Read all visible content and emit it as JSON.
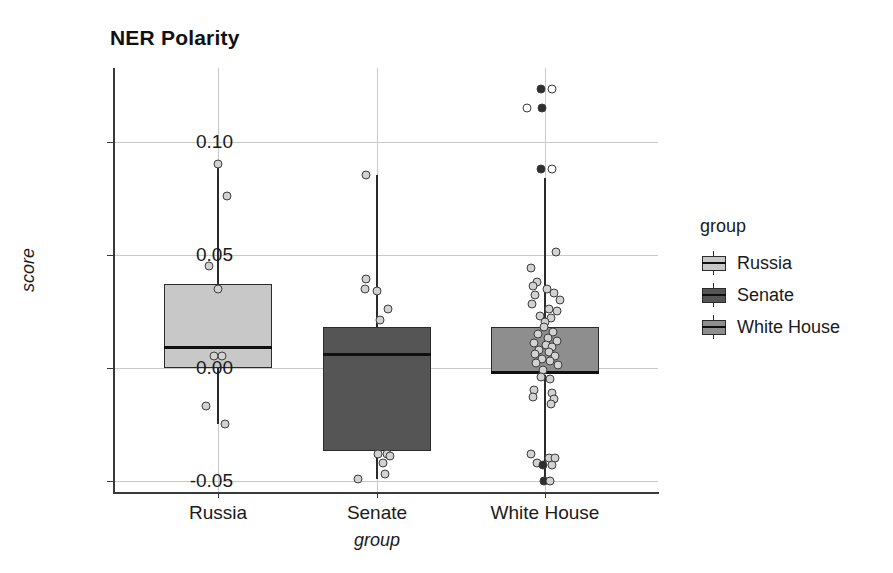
{
  "chart_data": {
    "type": "box",
    "title": "NER Polarity",
    "xlabel": "group",
    "ylabel": "score",
    "categories": [
      "Russia",
      "Senate",
      "White House"
    ],
    "ylim": [
      -0.062,
      0.132
    ],
    "yticks": [
      0.1,
      0.05,
      0.0,
      -0.05
    ],
    "ytick_labels": [
      "0.10",
      "0.05",
      "0.00",
      "-0.05"
    ],
    "grid": "horizontal-and-vertical",
    "legend": {
      "title": "group",
      "position": "right",
      "entries": [
        {
          "label": "Russia",
          "color": "#c8c8c8"
        },
        {
          "label": "Senate",
          "color": "#555555"
        },
        {
          "label": "White House",
          "color": "#8e8e8e"
        }
      ]
    },
    "boxes": [
      {
        "category": "Russia",
        "color": "#c8c8c8",
        "q1": 0.0,
        "median": 0.009,
        "q3": 0.037,
        "whisker_low": -0.025,
        "whisker_high": 0.09,
        "points": [
          {
            "value": 0.09,
            "offset": 0
          },
          {
            "value": 0.076,
            "offset": 9
          },
          {
            "value": 0.045,
            "offset": -9
          },
          {
            "value": 0.035,
            "offset": 0
          },
          {
            "value": 0.005,
            "offset": -4
          },
          {
            "value": 0.005,
            "offset": 4
          },
          {
            "value": -0.017,
            "offset": -12
          },
          {
            "value": -0.025,
            "offset": 7
          }
        ]
      },
      {
        "category": "Senate",
        "color": "#555555",
        "q1": -0.037,
        "median": 0.006,
        "q3": 0.018,
        "whisker_low": -0.049,
        "whisker_high": 0.085,
        "points": [
          {
            "value": 0.085,
            "offset": -11
          },
          {
            "value": 0.039,
            "offset": -11
          },
          {
            "value": 0.035,
            "offset": -12
          },
          {
            "value": 0.034,
            "offset": 0
          },
          {
            "value": 0.026,
            "offset": 11
          },
          {
            "value": 0.021,
            "offset": 3
          },
          {
            "value": -0.038,
            "offset": 1
          },
          {
            "value": -0.038,
            "offset": 10
          },
          {
            "value": -0.039,
            "offset": 13
          },
          {
            "value": -0.042,
            "offset": 6
          },
          {
            "value": -0.047,
            "offset": 8
          },
          {
            "value": -0.049,
            "offset": -19
          }
        ]
      },
      {
        "category": "White House",
        "color": "#8e8e8e",
        "q1": -0.003,
        "median": -0.002,
        "q3": 0.018,
        "whisker_low": -0.05,
        "whisker_high": 0.084,
        "points": [
          {
            "value": 0.123,
            "offset": -4,
            "fill": "dark"
          },
          {
            "value": 0.123,
            "offset": 7,
            "fill": "hollow"
          },
          {
            "value": 0.115,
            "offset": -18,
            "fill": "hollow"
          },
          {
            "value": 0.115,
            "offset": -3,
            "fill": "dark"
          },
          {
            "value": 0.088,
            "offset": -4,
            "fill": "dark"
          },
          {
            "value": 0.088,
            "offset": 7,
            "fill": "hollow"
          },
          {
            "value": 0.051,
            "offset": 11,
            "fill": "light"
          },
          {
            "value": 0.044,
            "offset": -14,
            "fill": "light"
          },
          {
            "value": 0.038,
            "offset": -8,
            "fill": "light"
          },
          {
            "value": 0.036,
            "offset": -12,
            "fill": "light"
          },
          {
            "value": 0.035,
            "offset": 2,
            "fill": "light"
          },
          {
            "value": 0.033,
            "offset": 9,
            "fill": "light"
          },
          {
            "value": 0.032,
            "offset": -10,
            "fill": "light"
          },
          {
            "value": 0.03,
            "offset": 15,
            "fill": "light"
          },
          {
            "value": 0.028,
            "offset": -13,
            "fill": "light"
          },
          {
            "value": 0.026,
            "offset": 4,
            "fill": "light"
          },
          {
            "value": 0.025,
            "offset": 12,
            "fill": "light"
          },
          {
            "value": 0.023,
            "offset": -5,
            "fill": "light"
          },
          {
            "value": 0.022,
            "offset": 6,
            "fill": "light"
          },
          {
            "value": 0.02,
            "offset": 0,
            "fill": "light"
          },
          {
            "value": 0.018,
            "offset": -1,
            "fill": "light"
          },
          {
            "value": 0.016,
            "offset": 8,
            "fill": "light"
          },
          {
            "value": 0.015,
            "offset": -7,
            "fill": "light"
          },
          {
            "value": 0.013,
            "offset": 3,
            "fill": "light"
          },
          {
            "value": 0.012,
            "offset": 12,
            "fill": "light"
          },
          {
            "value": 0.011,
            "offset": -11,
            "fill": "light"
          },
          {
            "value": 0.01,
            "offset": 1,
            "fill": "light"
          },
          {
            "value": 0.009,
            "offset": 7,
            "fill": "light"
          },
          {
            "value": 0.008,
            "offset": -6,
            "fill": "light"
          },
          {
            "value": 0.007,
            "offset": 4,
            "fill": "light"
          },
          {
            "value": 0.006,
            "offset": -10,
            "fill": "light"
          },
          {
            "value": 0.005,
            "offset": 10,
            "fill": "light"
          },
          {
            "value": 0.004,
            "offset": -3,
            "fill": "light"
          },
          {
            "value": 0.003,
            "offset": 5,
            "fill": "light"
          },
          {
            "value": 0.002,
            "offset": -9,
            "fill": "light"
          },
          {
            "value": 0.001,
            "offset": 13,
            "fill": "light"
          },
          {
            "value": -0.001,
            "offset": -2,
            "fill": "light"
          },
          {
            "value": -0.004,
            "offset": -4,
            "fill": "light"
          },
          {
            "value": -0.005,
            "offset": 5,
            "fill": "light"
          },
          {
            "value": -0.01,
            "offset": -11,
            "fill": "light"
          },
          {
            "value": -0.011,
            "offset": 7,
            "fill": "light"
          },
          {
            "value": -0.013,
            "offset": -12,
            "fill": "light"
          },
          {
            "value": -0.014,
            "offset": 9,
            "fill": "light"
          },
          {
            "value": -0.016,
            "offset": 6,
            "fill": "light"
          },
          {
            "value": -0.038,
            "offset": -14,
            "fill": "light"
          },
          {
            "value": -0.04,
            "offset": 4,
            "fill": "light"
          },
          {
            "value": -0.04,
            "offset": 10,
            "fill": "light"
          },
          {
            "value": -0.042,
            "offset": -8,
            "fill": "light"
          },
          {
            "value": -0.043,
            "offset": -2,
            "fill": "dark"
          },
          {
            "value": -0.043,
            "offset": 7,
            "fill": "light"
          },
          {
            "value": -0.05,
            "offset": -1,
            "fill": "dark"
          },
          {
            "value": -0.05,
            "offset": 5,
            "fill": "light"
          }
        ]
      }
    ]
  },
  "geometry": {
    "panel": {
      "left": 113,
      "top": 68,
      "width": 545,
      "height": 424
    },
    "y_axis": {
      "pixel_at_top": 68,
      "value_at_top": 0.1325,
      "pixel_per_unit": 2262
    },
    "x_centers": [
      218,
      377,
      545
    ],
    "box_half_width": 54
  }
}
